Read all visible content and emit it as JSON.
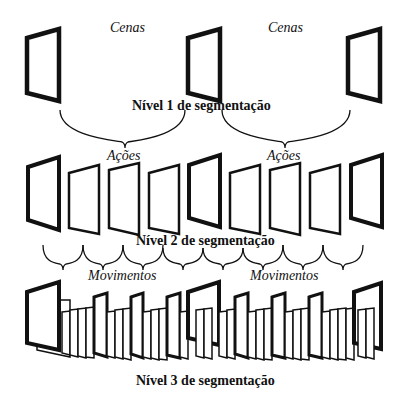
{
  "diagram": {
    "colors": {
      "stroke": "#111111",
      "background": "#ffffff"
    },
    "level1": {
      "title": "Nível 1 de segmentação",
      "group_labels": [
        "Cenas",
        "Cenas"
      ],
      "frame_count": 3
    },
    "level2": {
      "title": "Nível 2 de segmentação",
      "group_labels": [
        "Ações",
        "Ações"
      ],
      "frame_count": 9
    },
    "level3": {
      "title": "Nível 3 de segmentação",
      "group_labels": [
        "Movimentos",
        "Movimentos"
      ],
      "keyframe_count": 9
    }
  }
}
